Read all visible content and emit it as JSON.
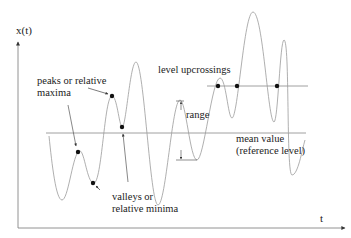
{
  "diagram": {
    "axes": {
      "y_label": "x(t)",
      "x_label": "t"
    },
    "labels": {
      "peaks_line1": "peaks or relative",
      "peaks_line2": "maxima",
      "valleys_line1": "valleys or",
      "valleys_line2": "relative minima",
      "upcrossings": "level upcrossings",
      "range": "range",
      "mean_line1": "mean value",
      "mean_line2": "(reference level)"
    },
    "colors": {
      "curve": "#9a9a9a",
      "axis": "#555555",
      "dot": "#111111",
      "text": "#222222"
    }
  }
}
